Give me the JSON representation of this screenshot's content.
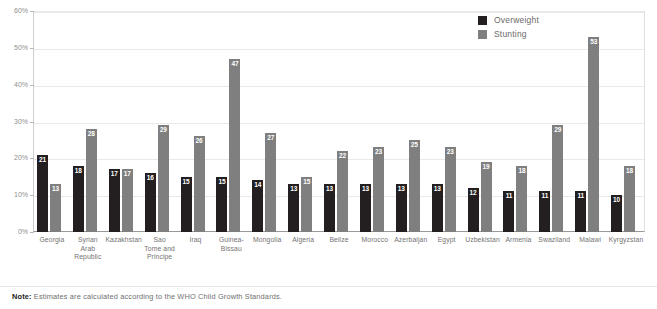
{
  "chart_data": {
    "type": "bar",
    "title": "",
    "subtitle": "",
    "xlabel": "",
    "ylabel": "",
    "ylim": [
      0,
      60
    ],
    "ytick_labels": [
      "0%",
      "10%",
      "20%",
      "30%",
      "40%",
      "50%",
      "60%"
    ],
    "ytick_values": [
      0,
      10,
      20,
      30,
      40,
      50,
      60
    ],
    "grid": true,
    "legend_position": "top-right",
    "categories": [
      "Georgia",
      "Syrian Arab Republic",
      "Kazakhstan",
      "Sao Tome and Principe",
      "Iraq",
      "Guinea-Bissau",
      "Mongolia",
      "Algeria",
      "Belize",
      "Morocco",
      "Azerbaijan",
      "Egypt",
      "Uzbekistan",
      "Armenia",
      "Swaziland",
      "Malawi",
      "Kyrgyzstan"
    ],
    "category_lines": [
      [
        "Georgia"
      ],
      [
        "Syrian",
        "Arab",
        "Republic"
      ],
      [
        "Kazakhstan"
      ],
      [
        "Sao",
        "Tome and",
        "Principe"
      ],
      [
        "Iraq"
      ],
      [
        "Guinea-",
        "Bissau"
      ],
      [
        "Mongolia"
      ],
      [
        "Algeria"
      ],
      [
        "Belize"
      ],
      [
        "Morocco"
      ],
      [
        "Azerbaijan"
      ],
      [
        "Egypt"
      ],
      [
        "Uzbekistan"
      ],
      [
        "Armenia"
      ],
      [
        "Swaziland"
      ],
      [
        "Malawi"
      ],
      [
        "Kyrgyzstan"
      ]
    ],
    "series": [
      {
        "name": "Overweight",
        "color": "#231f20",
        "values": [
          21,
          18,
          17,
          16,
          15,
          15,
          14,
          13,
          13,
          13,
          13,
          13,
          12,
          11,
          11,
          11,
          10
        ]
      },
      {
        "name": "Stunting",
        "color": "#7f7f7f",
        "values": [
          13,
          28,
          17,
          29,
          26,
          47,
          27,
          15,
          22,
          23,
          25,
          23,
          19,
          18,
          29,
          53,
          18
        ]
      }
    ],
    "annotations": {
      "note_prefix": "Note:",
      "note_text": "Estimates are calculated according to the WHO Child Growth Standards."
    }
  },
  "legend": {
    "items": [
      {
        "label": "Overweight",
        "color": "#231f20"
      },
      {
        "label": "Stunting",
        "color": "#7f7f7f"
      }
    ]
  }
}
